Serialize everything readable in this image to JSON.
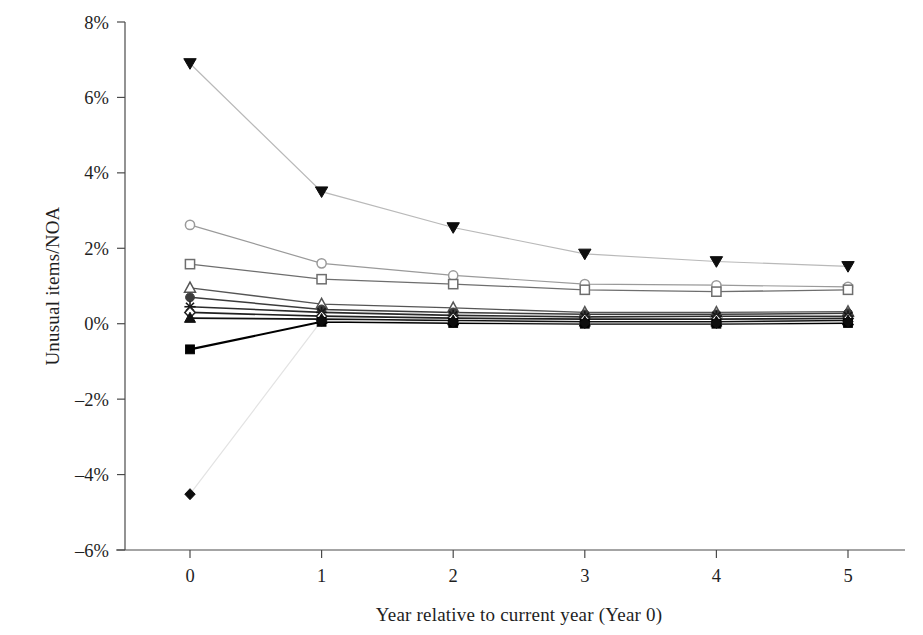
{
  "chart_data": {
    "type": "line",
    "title": "",
    "subtitle": "",
    "xlabel": "Year relative to current year (Year 0)",
    "ylabel": "Unusual items/NOA",
    "x": [
      0,
      1,
      2,
      3,
      4,
      5
    ],
    "xtick_labels": [
      "0",
      "1",
      "2",
      "3",
      "4",
      "5"
    ],
    "ytick_labels": [
      "8%",
      "6%",
      "4%",
      "2%",
      "0%",
      "–2%",
      "–4%",
      "–6%"
    ],
    "ytick_values": [
      8,
      6,
      4,
      2,
      0,
      -2,
      -4,
      -6
    ],
    "xlim": [
      -0.5,
      5.5
    ],
    "ylim": [
      -6,
      8
    ],
    "grid": false,
    "legend": "none",
    "value_unit": "percent",
    "series": [
      {
        "name": "Portfolio 1 (most negative unusual items)",
        "marker": "triangle-down-filled",
        "color": "#b9b9b9",
        "line_width": 1.2,
        "values": [
          6.9,
          3.5,
          2.55,
          1.85,
          1.65,
          1.52
        ]
      },
      {
        "name": "Portfolio 2",
        "marker": "circle-open",
        "color": "#9a9a9a",
        "line_width": 1.2,
        "values": [
          2.62,
          1.6,
          1.28,
          1.05,
          1.02,
          0.98
        ]
      },
      {
        "name": "Portfolio 3",
        "marker": "square-open",
        "color": "#6e6e6e",
        "line_width": 1.3,
        "values": [
          1.58,
          1.18,
          1.05,
          0.9,
          0.85,
          0.9
        ]
      },
      {
        "name": "Portfolio 4",
        "marker": "triangle-up-open",
        "color": "#555555",
        "line_width": 1.4,
        "values": [
          0.95,
          0.52,
          0.42,
          0.3,
          0.3,
          0.32
        ]
      },
      {
        "name": "Portfolio 5",
        "marker": "circle-filled",
        "color": "#3b3b3b",
        "line_width": 1.5,
        "values": [
          0.7,
          0.38,
          0.3,
          0.25,
          0.25,
          0.28
        ]
      },
      {
        "name": "Portfolio 6",
        "marker": "asterisk",
        "color": "#2b2b2b",
        "line_width": 1.6,
        "values": [
          0.45,
          0.3,
          0.22,
          0.18,
          0.2,
          0.2
        ]
      },
      {
        "name": "Portfolio 7",
        "marker": "diamond-open",
        "color": "#202020",
        "line_width": 1.7,
        "values": [
          0.3,
          0.2,
          0.15,
          0.12,
          0.12,
          0.14
        ]
      },
      {
        "name": "Portfolio 8",
        "marker": "triangle-up-filled",
        "color": "#111111",
        "line_width": 1.8,
        "values": [
          0.15,
          0.12,
          0.08,
          0.05,
          0.05,
          0.08
        ]
      },
      {
        "name": "Portfolio 9",
        "marker": "square-filled",
        "color": "#000000",
        "line_width": 2.1,
        "values": [
          -0.68,
          0.05,
          0.02,
          0.0,
          0.0,
          0.02
        ]
      },
      {
        "name": "Portfolio 10 (most positive unusual items)",
        "marker": "diamond-filled",
        "color": "#e3e3e3",
        "line_width": 1.2,
        "values": [
          -4.52,
          0.08,
          0.05,
          0.02,
          0.02,
          0.05
        ]
      }
    ]
  },
  "axes": {
    "axis_color": "#4a4a4a",
    "axis_width": 1.2,
    "tick_length": 8
  }
}
